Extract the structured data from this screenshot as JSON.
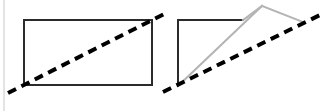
{
  "canvas": {
    "width": 329,
    "height": 111,
    "background": "#ffffff"
  },
  "colors": {
    "dark_stroke": "#2b2b2b",
    "gray_stroke": "#b4b4b4",
    "dashed_stroke": "#000000",
    "page_edge": "#c8c8c8"
  },
  "page_edge": {
    "name": "left-page-edge-rule",
    "x": 4,
    "y1": 0,
    "y2": 111,
    "width": 1
  },
  "figures": [
    {
      "id": "left-figure",
      "label": "rectangle-with-diagonal",
      "shapes": [
        {
          "name": "rectangle-outline",
          "type": "rect",
          "x": 24,
          "y": 20,
          "width": 128,
          "height": 65,
          "stroke": "#2b2b2b",
          "stroke_width": 2,
          "fill": "none"
        },
        {
          "name": "diagonal-dashed-line",
          "type": "line",
          "x1": 8,
          "y1": 93,
          "x2": 168,
          "y2": 12,
          "stroke": "#000000",
          "stroke_width": 4,
          "dash": "9 6"
        }
      ]
    },
    {
      "id": "right-figure",
      "label": "open-shape-with-gray-triangle-and-diagonal",
      "shapes": [
        {
          "name": "dark-top-edge",
          "type": "line",
          "x1": 178,
          "y1": 20,
          "x2": 243,
          "y2": 20,
          "stroke": "#2b2b2b",
          "stroke_width": 2
        },
        {
          "name": "dark-left-edge",
          "type": "line",
          "x1": 178,
          "y1": 20,
          "x2": 178,
          "y2": 86,
          "stroke": "#2b2b2b",
          "stroke_width": 2
        },
        {
          "name": "gray-rising-edge",
          "type": "line",
          "x1": 178,
          "y1": 86,
          "x2": 262,
          "y2": 6,
          "stroke": "#b4b4b4",
          "stroke_width": 2
        },
        {
          "name": "gray-falling-edge",
          "type": "line",
          "x1": 262,
          "y1": 6,
          "x2": 303,
          "y2": 22,
          "stroke": "#b4b4b4",
          "stroke_width": 2
        },
        {
          "name": "gray-cross-edge",
          "type": "line",
          "x1": 243,
          "y1": 20,
          "x2": 262,
          "y2": 6,
          "stroke": "#b4b4b4",
          "stroke_width": 2
        },
        {
          "name": "diagonal-dashed-line",
          "type": "line",
          "x1": 163,
          "y1": 92,
          "x2": 322,
          "y2": 14,
          "stroke": "#000000",
          "stroke_width": 4,
          "dash": "9 6"
        }
      ]
    }
  ]
}
